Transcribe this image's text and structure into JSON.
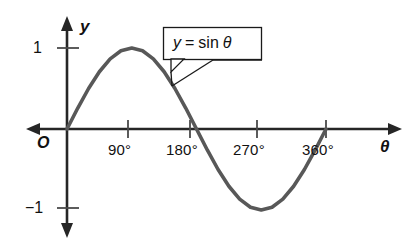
{
  "chart_data": {
    "type": "line",
    "title": "",
    "subtitle": "",
    "xlabel": "θ",
    "ylabel": "y",
    "origin_label": "O",
    "grid": false,
    "legend_position": "inline-callout",
    "annotations": [
      {
        "name": "curve-callout",
        "text": "y = sin θ",
        "text_parts": {
          "variable": "y",
          "operator": "=",
          "function": "sin",
          "argument": "θ"
        },
        "points_to_x_deg": 135,
        "points_to_y": 0.7071
      }
    ],
    "x_tick_labels": [
      "90°",
      "180°",
      "270°",
      "360°"
    ],
    "x_tick_values": [
      90,
      180,
      270,
      360
    ],
    "y_tick_labels": [
      "1",
      "−1"
    ],
    "y_tick_values": [
      1,
      -1
    ],
    "xlim": [
      -20,
      400
    ],
    "ylim": [
      -1.35,
      1.35
    ],
    "series": [
      {
        "name": "y = sin θ",
        "color": "#585858",
        "x": [
          0,
          15,
          30,
          45,
          60,
          75,
          90,
          105,
          120,
          135,
          150,
          165,
          180,
          195,
          210,
          225,
          240,
          255,
          270,
          285,
          300,
          315,
          330,
          345,
          360
        ],
        "values": [
          0,
          0.259,
          0.5,
          0.707,
          0.866,
          0.966,
          1,
          0.966,
          0.866,
          0.707,
          0.5,
          0.259,
          0,
          -0.259,
          -0.5,
          -0.707,
          -0.866,
          -0.966,
          -1,
          -0.966,
          -0.866,
          -0.707,
          -0.5,
          -0.259,
          0
        ]
      }
    ],
    "key_points": {
      "maximum": {
        "x_deg": 90,
        "y": 1
      },
      "zeros": [
        0,
        180,
        360
      ],
      "minimum": {
        "x_deg": 270,
        "y": -1
      }
    },
    "colors": {
      "curve": "#585858",
      "axis": "#262626",
      "text": "#111111",
      "background": "#ffffff"
    }
  }
}
